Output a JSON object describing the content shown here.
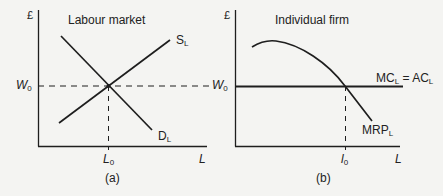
{
  "panel_a": {
    "title": "Labour market",
    "y_axis_symbol": "£",
    "x_axis_symbol": "L",
    "wage_label": "W",
    "wage_sub": "0",
    "quantity_label": "L",
    "quantity_sub": "0",
    "supply_label": "S",
    "supply_sub": "L",
    "demand_label": "D",
    "demand_sub": "L",
    "caption": "(a)"
  },
  "panel_b": {
    "title": "Individual firm",
    "y_axis_symbol": "£",
    "x_axis_symbol": "L",
    "wage_label": "W",
    "wage_sub": "0",
    "quantity_label": "l",
    "quantity_sub": "0",
    "cost_label_mc": "MC",
    "cost_label_mc_sub": "L",
    "cost_label_eq": " = ",
    "cost_label_ac": "AC",
    "cost_label_ac_sub": "L",
    "mrp_label": "MRP",
    "mrp_sub": "L",
    "caption": "(b)"
  },
  "colors": {
    "line": "#1e1e1e",
    "background": "#f4f4f2"
  }
}
